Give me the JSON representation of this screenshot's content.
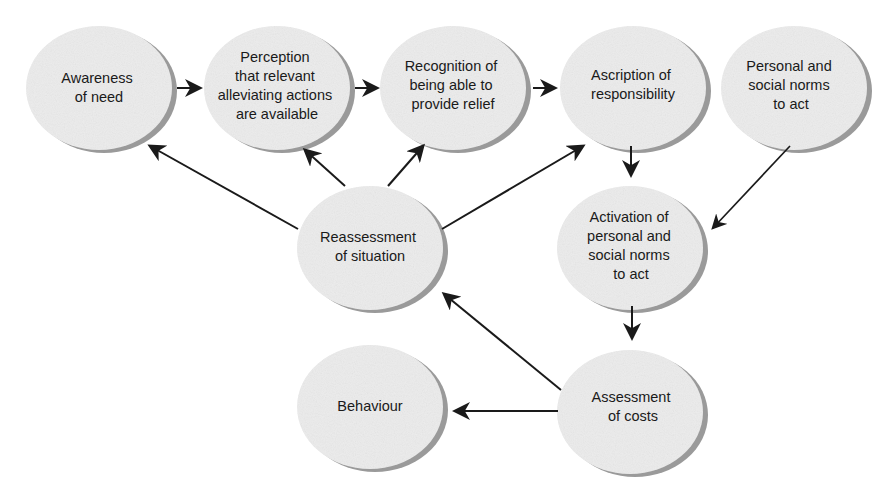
{
  "diagram": {
    "type": "flow",
    "colors": {
      "node_fill": "#ececec",
      "node_shadow": "#9a9a9a",
      "arrow": "#1a1a1a",
      "background": "#ffffff"
    },
    "nodes": [
      {
        "id": "awareness",
        "lines": [
          "Awareness",
          "of need"
        ]
      },
      {
        "id": "perception",
        "lines": [
          "Perception",
          "that relevant",
          "alleviating actions",
          "are available"
        ]
      },
      {
        "id": "recognition",
        "lines": [
          "Recognition of",
          "being able to",
          "provide relief"
        ]
      },
      {
        "id": "ascription",
        "lines": [
          "Ascription of",
          "responsibility"
        ]
      },
      {
        "id": "personal-norms",
        "lines": [
          "Personal and",
          "social norms",
          "to act"
        ]
      },
      {
        "id": "reassessment",
        "lines": [
          "Reassessment",
          "of situation"
        ]
      },
      {
        "id": "activation",
        "lines": [
          "Activation of",
          "personal and",
          "social norms",
          "to act"
        ]
      },
      {
        "id": "behaviour",
        "lines": [
          "Behaviour"
        ]
      },
      {
        "id": "assessment",
        "lines": [
          "Assessment",
          "of costs"
        ]
      }
    ],
    "edges": [
      {
        "from": "awareness",
        "to": "perception"
      },
      {
        "from": "perception",
        "to": "recognition"
      },
      {
        "from": "recognition",
        "to": "ascription"
      },
      {
        "from": "ascription",
        "to": "activation"
      },
      {
        "from": "personal-norms",
        "to": "activation"
      },
      {
        "from": "activation",
        "to": "assessment"
      },
      {
        "from": "assessment",
        "to": "behaviour"
      },
      {
        "from": "assessment",
        "to": "reassessment"
      },
      {
        "from": "reassessment",
        "to": "awareness"
      },
      {
        "from": "reassessment",
        "to": "perception"
      },
      {
        "from": "reassessment",
        "to": "recognition"
      },
      {
        "from": "reassessment",
        "to": "ascription"
      }
    ]
  }
}
